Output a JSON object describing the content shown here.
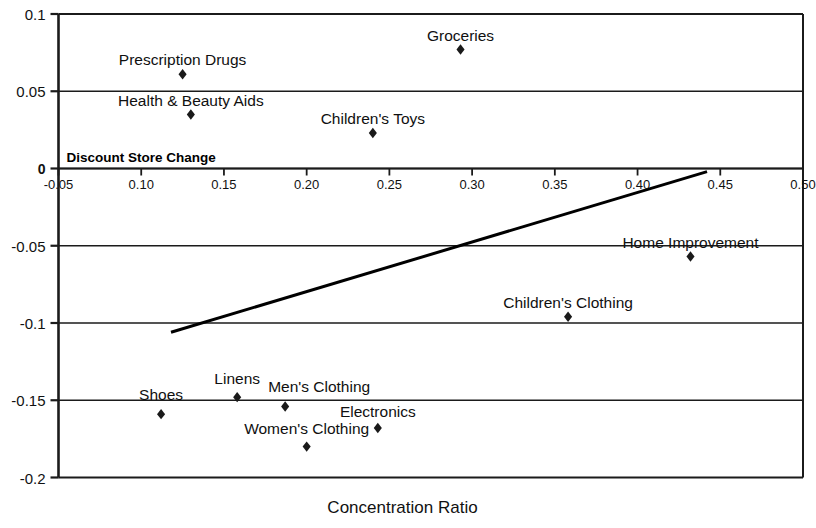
{
  "chart_data": {
    "type": "scatter",
    "title": "",
    "subtitle": "",
    "xlabel": "Concentration Ratio",
    "ylabel": "",
    "series_annotation": "Discount  Store Change",
    "xlim": [
      0.05,
      0.5
    ],
    "ylim": [
      -0.2,
      0.1
    ],
    "grid": true,
    "legend": "none",
    "xticks": [
      "-0.05",
      "0.10",
      "0.15",
      "0.20",
      "0.25",
      "0.30",
      "0.35",
      "0.40",
      "0.45",
      "0.50"
    ],
    "xtick_values": [
      0.05,
      0.1,
      0.15,
      0.2,
      0.25,
      0.3,
      0.35,
      0.4,
      0.45,
      0.5
    ],
    "yticks": [
      "0.1",
      "0.05",
      "0",
      "-0.05",
      "-0.1",
      "-0.15",
      "-0.2"
    ],
    "ytick_values": [
      0.1,
      0.05,
      0,
      -0.05,
      -0.1,
      -0.15,
      -0.2
    ],
    "marker": "diamond",
    "marker_color": "#1a1a1a",
    "trendline": {
      "x": [
        0.118,
        0.442
      ],
      "y": [
        -0.106,
        -0.002
      ],
      "color": "#000000",
      "width": 3
    },
    "points": [
      {
        "label": "Prescription Drugs",
        "x": 0.125,
        "y": 0.061,
        "label_dx": 0,
        "label_dy": -22
      },
      {
        "label": "Groceries",
        "x": 0.293,
        "y": 0.077,
        "label_dx": 0,
        "label_dy": -22
      },
      {
        "label": "Health & Beauty Aids",
        "x": 0.13,
        "y": 0.035,
        "label_dx": 0,
        "label_dy": -21
      },
      {
        "label": "Children's Toys",
        "x": 0.24,
        "y": 0.023,
        "label_dx": 0,
        "label_dy": -22
      },
      {
        "label": "Home Improvement",
        "x": 0.432,
        "y": -0.057,
        "label_dx": 0,
        "label_dy": -22
      },
      {
        "label": "Children's Clothing",
        "x": 0.358,
        "y": -0.096,
        "label_dx": 0,
        "label_dy": -22
      },
      {
        "label": "Linens",
        "x": 0.158,
        "y": -0.148,
        "label_dx": 0,
        "label_dy": -26
      },
      {
        "label": "Shoes",
        "x": 0.112,
        "y": -0.159,
        "label_dx": 0,
        "label_dy": -27
      },
      {
        "label": "Men's Clothing",
        "x": 0.187,
        "y": -0.154,
        "label_dx": 34,
        "label_dy": -27
      },
      {
        "label": "Women's Clothing",
        "x": 0.2,
        "y": -0.18,
        "label_dx": 0,
        "label_dy": -26
      },
      {
        "label": "Electronics",
        "x": 0.243,
        "y": -0.168,
        "label_dx": 0,
        "label_dy": -24
      }
    ]
  }
}
